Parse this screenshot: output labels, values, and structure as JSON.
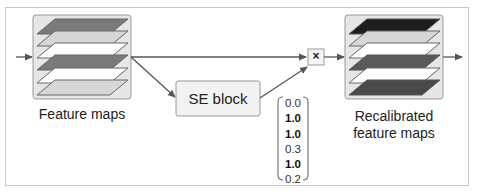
{
  "diagram": {
    "input_label": "Feature maps",
    "se_block_label": "SE block",
    "multiply_symbol": "×",
    "output_label_line1": "Recalibrated",
    "output_label_line2": "feature maps",
    "scale_vector": [
      "0.0",
      "1.0",
      "1.0",
      "0.3",
      "1.0",
      "0.2"
    ],
    "scale_vector_bold": [
      false,
      true,
      true,
      false,
      true,
      false
    ],
    "input_layer_colors": [
      "#7a7a7a",
      "#d6d6d6",
      "#ffffff",
      "#7a7a7a",
      "#ffffff",
      "#d6d6d6"
    ],
    "output_layer_colors": [
      "#1e1e1e",
      "#d6d6d6",
      "#ffffff",
      "#5a5a5a",
      "#ffffff",
      "#4a4a4a"
    ]
  }
}
